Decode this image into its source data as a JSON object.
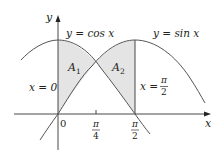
{
  "figure": {
    "type": "area-between-curves",
    "colors": {
      "fill": "#e4e4e4",
      "curve": "#555555",
      "axis": "#333333",
      "text": "#231f20"
    }
  },
  "axes": {
    "x_label": "x",
    "y_label": "y",
    "origin_label": "0",
    "ticks": [
      {
        "id": "pi_over_4",
        "num": "π",
        "den": "4"
      },
      {
        "id": "pi_over_2",
        "num": "π",
        "den": "2"
      }
    ]
  },
  "curves": {
    "cos_label": "y = cos x",
    "sin_label": "y = sin x"
  },
  "lines": {
    "left_boundary_label": "x = 0",
    "right_boundary_label_prefix": "x =",
    "right_boundary_num": "π",
    "right_boundary_den": "2"
  },
  "regions": {
    "a1": {
      "letter": "A",
      "sub": "1"
    },
    "a2": {
      "letter": "A",
      "sub": "2"
    }
  }
}
